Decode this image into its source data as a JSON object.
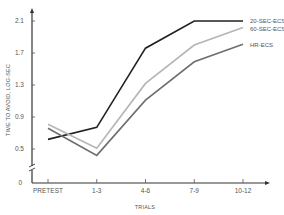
{
  "chart_data": {
    "type": "line",
    "title": "",
    "xlabel": "TRIALS",
    "ylabel": "TIME TO AVOID, LOG-SEC",
    "categories": [
      "PRETEST",
      "1-3",
      "4-6",
      "7-9",
      "10-12"
    ],
    "y_ticks": [
      0,
      0.5,
      0.9,
      1.3,
      1.7,
      2.1
    ],
    "y_tick_labels": [
      "0",
      "0.5",
      "0.9",
      "1.3",
      "1.7",
      "2.1"
    ],
    "ylim": [
      0,
      2.2
    ],
    "axis_break": true,
    "grid": false,
    "legend_placement": "right (inline labels at line ends)",
    "series": [
      {
        "name": "20-SEC-ECS",
        "color": "#222222",
        "values": [
          0.62,
          0.77,
          1.76,
          2.1,
          2.1
        ]
      },
      {
        "name": "60-SEC-ECS",
        "color": "#b5b5b5",
        "values": [
          0.81,
          0.51,
          1.32,
          1.8,
          2.02
        ]
      },
      {
        "name": "HR-ECS",
        "color": "#6e6e6e",
        "values": [
          0.76,
          0.42,
          1.11,
          1.59,
          1.81
        ]
      }
    ]
  }
}
